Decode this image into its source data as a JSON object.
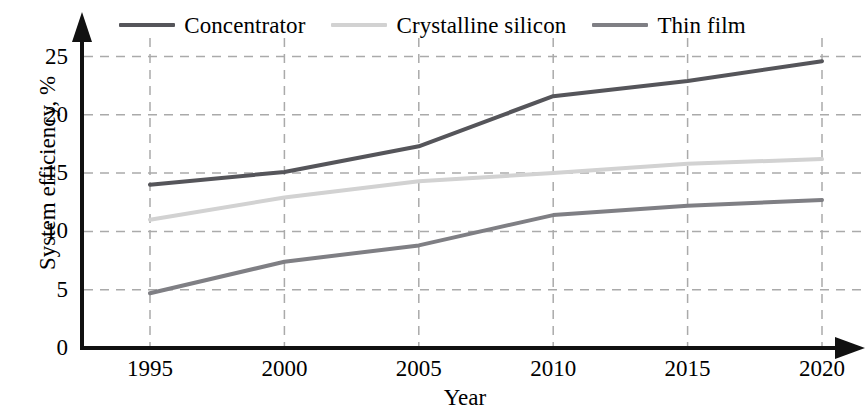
{
  "chart_data": {
    "type": "line",
    "title": "",
    "subtitle": "",
    "xlabel": "Year",
    "ylabel": "System efficiency, %",
    "x": [
      1995,
      2000,
      2005,
      2010,
      2015,
      2020
    ],
    "categories": [
      "1995",
      "2000",
      "2005",
      "2010",
      "2015",
      "2020"
    ],
    "xlim": [
      1993,
      2021
    ],
    "ylim": [
      0,
      26.5
    ],
    "yticks": [
      0,
      5,
      10,
      15,
      20,
      25
    ],
    "ytick_labels": [
      "0",
      "5",
      "10",
      "15",
      "20",
      "25"
    ],
    "xticks": [
      1995,
      2000,
      2005,
      2010,
      2015,
      2020
    ],
    "xtick_labels": [
      "1995",
      "2000",
      "2005",
      "2010",
      "2015",
      "2020"
    ],
    "grid": true,
    "grid_style": "dashed",
    "grid_color": "#aaaaaa",
    "legend_position": "top-center",
    "axis_arrows": true,
    "series": [
      {
        "name": "Concentrator",
        "color": "#55555a",
        "values": [
          14.0,
          15.1,
          17.3,
          21.6,
          22.9,
          24.6
        ]
      },
      {
        "name": "Crystalline silicon",
        "color": "#d2d2d2",
        "values": [
          11.0,
          12.9,
          14.3,
          15.0,
          15.8,
          16.2
        ]
      },
      {
        "name": "Thin film",
        "color": "#7f7f84",
        "values": [
          4.7,
          7.4,
          8.8,
          11.4,
          12.2,
          12.7
        ]
      }
    ]
  },
  "legend": {
    "items": [
      {
        "label": "Concentrator",
        "color": "#55555a"
      },
      {
        "label": "Crystalline silicon",
        "color": "#d2d2d2"
      },
      {
        "label": "Thin film",
        "color": "#7f7f84"
      }
    ]
  },
  "axes": {
    "y_title": "System efficiency, %",
    "x_title": "Year",
    "y_labels": [
      "25",
      "20",
      "15",
      "10",
      "5",
      "0"
    ],
    "x_labels": [
      "1995",
      "2000",
      "2005",
      "2010",
      "2015",
      "2020"
    ]
  }
}
